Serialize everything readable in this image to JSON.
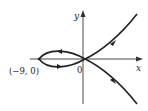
{
  "diagram": {
    "type": "parametric-curve",
    "axes": {
      "x_label": "x",
      "y_label": "y",
      "origin_label": "0"
    },
    "points": [
      {
        "label": "(−9, 0)",
        "x": -9,
        "y": 0
      }
    ],
    "curve": {
      "description": "Curve with a loop to the left of the origin through (-9, 0), self-intersecting at the origin, with branches extending to upper-right and lower-right",
      "direction_arrows": [
        "loop-top-leftward",
        "loop-bottom-rightward",
        "upper-branch-toward-origin",
        "lower-branch-toward-origin"
      ]
    },
    "colors": {
      "ink": "#222222",
      "background": "#ffffff"
    }
  }
}
